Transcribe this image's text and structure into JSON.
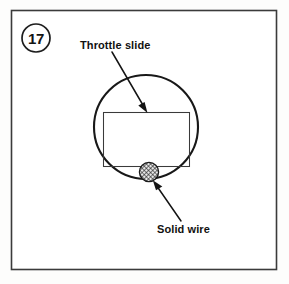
{
  "figure": {
    "number_badge": "17",
    "background_color": "#fdfdfc",
    "frame_color": "#3b3b3b"
  },
  "callouts": {
    "throttle_slide": {
      "label": "Throttle slide",
      "icon": "arrow-down-right-icon"
    },
    "solid_wire": {
      "label": "Solid wire",
      "icon": "arrow-up-left-icon"
    }
  },
  "parts": {
    "bore_circle": {
      "name": "carburetor bore",
      "stroke_color": "#181818"
    },
    "slide_rect": {
      "name": "throttle slide",
      "stroke_color": "#3a3a3a"
    },
    "wire": {
      "name": "solid wire",
      "fill": "hatched",
      "stroke_color": "#1a1a1a"
    }
  }
}
